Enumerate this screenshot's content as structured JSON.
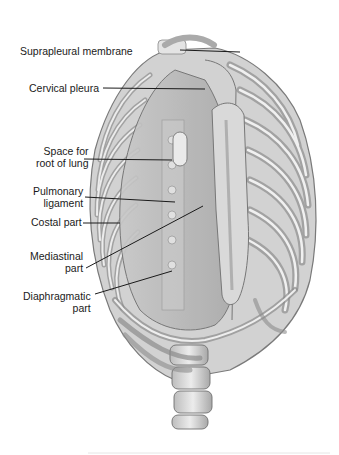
{
  "figure": {
    "labels": [
      {
        "id": "suprapleural-membrane",
        "lines": [
          "Suprapleural membrane"
        ],
        "x": 20,
        "y": 45,
        "anchor": [
          180,
          50
        ],
        "tip": [
          240,
          52
        ]
      },
      {
        "id": "cervical-pleura",
        "lines": [
          "Cervical pleura"
        ],
        "x": 29,
        "y": 82,
        "anchor": [
          103,
          88
        ],
        "tip": [
          205,
          89
        ]
      },
      {
        "id": "space-for-root-of-lung",
        "lines": [
          "Space for",
          "root of lung"
        ],
        "x": 36,
        "y": 145,
        "anchor": [
          84,
          159
        ],
        "tip": [
          172,
          160
        ]
      },
      {
        "id": "pulmonary-ligament",
        "lines": [
          "Pulmonary",
          "ligament"
        ],
        "x": 33,
        "y": 185,
        "anchor": [
          85,
          197
        ],
        "tip": [
          175,
          202
        ]
      },
      {
        "id": "costal-part",
        "lines": [
          "Costal part"
        ],
        "x": 31,
        "y": 216,
        "anchor": [
          83,
          223
        ],
        "tip": [
          120,
          223
        ]
      },
      {
        "id": "mediastinal-part",
        "lines": [
          "Mediastinal",
          "part"
        ],
        "x": 30,
        "y": 250,
        "anchor": [
          86,
          268
        ],
        "tip": [
          203,
          206
        ]
      },
      {
        "id": "diaphragmatic-part",
        "lines": [
          "Diaphragmatic",
          "part"
        ],
        "x": 23,
        "y": 290,
        "anchor": [
          95,
          294
        ],
        "tip": [
          172,
          271
        ]
      }
    ]
  },
  "colors": {
    "background": "#ffffff",
    "bone_light": "#e6e6e6",
    "bone_mid": "#c4c4c4",
    "bone_dark": "#8a8a8a",
    "pleura": "#b8b8b8",
    "outline": "#6e6e6e",
    "leader_line": "#1a1a1a",
    "label_text": "#1a1a1a"
  }
}
